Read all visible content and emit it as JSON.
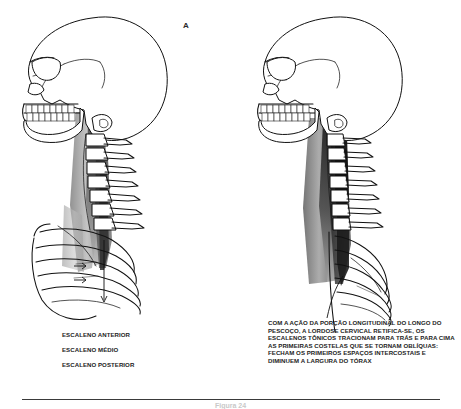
{
  "figure": {
    "type": "anatomical-illustration",
    "background_color": "#ffffff",
    "ink_color": "#111111",
    "language": "pt-BR",
    "caption_cropped": "Figura 24"
  },
  "panels": [
    {
      "id": "A",
      "letter": "A",
      "description": "Vista lateral do cranio, coluna cervical com lordose normal e caixa toracica com musculos escalenos sombreados",
      "labels": [
        "ESCALENO ANTERIOR",
        "ESCALENO MÉDIO",
        "ESCALENO POSTERIOR"
      ]
    },
    {
      "id": "B",
      "letter": "B",
      "description": "Vista lateral com lordose cervical retificada e primeiras costelas elevadas e obliquas",
      "text": "COM A AÇÃO DA PORÇÃO LONGITUDINAL DO LONGO DO PESCOÇO, A LORDOSE CERVICAL RETIFICA-SE, OS ESCALENOS TÔNICOS TRACIONAM PARA TRÁS E PARA CIMA AS PRIMEIRAS COSTELAS QUE SE TORNAM OBLÍQUAS: FECHAM OS PRIMEIROS ESPAÇOS INTERCOSTAIS E DIMINUEM A LARGURA DO TÓRAX"
    }
  ],
  "colors": {
    "muscle_dark": "#2f2f2f",
    "muscle_mid": "#6f6f6f",
    "muscle_light": "#b9b9b9",
    "outline": "#111111",
    "divider": "#3a3a3a"
  }
}
